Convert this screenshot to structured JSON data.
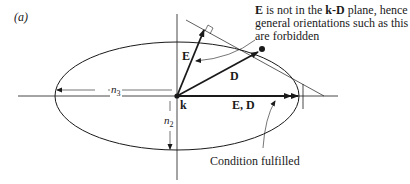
{
  "figure": {
    "panel_label": "(a)",
    "labels": {
      "E_vec": "E",
      "D_vec": "D",
      "origin": "k",
      "ED_vec": "E, D",
      "n3": "n",
      "n3_sub": "3",
      "n2": "n",
      "n2_sub": "2"
    },
    "annotations": {
      "forbidden_bold_E": "E",
      "forbidden_text_1": " is not in the ",
      "forbidden_bold_kD": "k-D",
      "forbidden_text_2": " plane, hence",
      "forbidden_line_2": "general orientations such as this",
      "forbidden_line_3": "are forbidden",
      "fulfilled": "Condition fulfilled"
    },
    "colors": {
      "ink": "#1a1a1a",
      "background": "#ffffff"
    }
  }
}
